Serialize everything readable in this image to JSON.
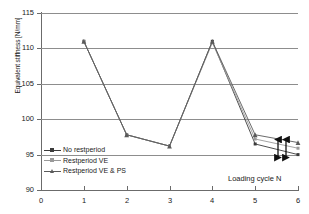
{
  "chart_data": {
    "type": "line",
    "title": "",
    "xlabel": "Loading cycle N",
    "ylabel": "Equivalent stiffness [N/mm]",
    "x": [
      1,
      2,
      3,
      4,
      5,
      6
    ],
    "xticklabels": [
      "0",
      "1",
      "2",
      "3",
      "4",
      "5",
      "6"
    ],
    "xlim": [
      0,
      6
    ],
    "ylim": [
      90,
      115
    ],
    "yticklabels": [
      "90",
      "95",
      "100",
      "105",
      "110",
      "115"
    ],
    "yticks": [
      90,
      95,
      100,
      105,
      110,
      115
    ],
    "grid": "horizontal",
    "legend_position": "lower-left-inside",
    "series": [
      {
        "name": "No restperiod",
        "color": "#3b3b3b",
        "marker": "square",
        "values": [
          111.0,
          97.8,
          96.2,
          111.0,
          96.5,
          95.0
        ]
      },
      {
        "name": "Restperiod VE",
        "color": "#9a9a9a",
        "marker": "square",
        "values": [
          111.0,
          97.8,
          96.2,
          110.8,
          97.2,
          95.9
        ]
      },
      {
        "name": "Restperiod VE & PS",
        "color": "#5a5a5a",
        "marker": "triangle",
        "values": [
          111.0,
          97.8,
          96.2,
          111.0,
          97.8,
          96.7
        ]
      }
    ],
    "annotations": [
      {
        "name": "delta-arrow-outer",
        "type": "double-arrow-vertical",
        "x": 6,
        "y_top": 96.7,
        "y_bottom": 95.0
      },
      {
        "name": "delta-arrow-inner",
        "type": "double-arrow-vertical",
        "x": 6,
        "y_top": 96.7,
        "y_bottom": 95.0
      }
    ]
  },
  "legend": {
    "items": [
      {
        "label": "No restperiod"
      },
      {
        "label": "Restperiod VE"
      },
      {
        "label": "Restperiod VE & PS"
      }
    ]
  }
}
